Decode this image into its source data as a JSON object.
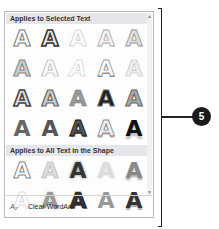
{
  "gallery": {
    "section1_title": "Applies to Selected Text",
    "section2_title": "Applies to All Text in the Shape",
    "glyph": "A",
    "section1_rows": [
      [
        {
          "style": "outline-gray"
        },
        {
          "style": "outline-dark"
        },
        {
          "style": "outline-light"
        },
        {
          "style": "outline-light-gray"
        },
        {
          "style": "outline-mid"
        }
      ],
      [
        {
          "style": "gray-soft"
        },
        {
          "style": "outline-faint"
        },
        {
          "style": "faint-italic"
        },
        {
          "style": "outline-shadow"
        },
        {
          "style": "pale"
        }
      ],
      [
        {
          "style": "dark-outline"
        },
        {
          "style": "gray-outline"
        },
        {
          "style": "gradient-gray"
        },
        {
          "style": "solid-black"
        },
        {
          "style": "outline-gray-mid"
        }
      ],
      [
        {
          "style": "solid-gray"
        },
        {
          "style": "solid-gray"
        },
        {
          "style": "dark-shadow"
        },
        {
          "style": "outline-reflect"
        },
        {
          "style": "black-reflect"
        }
      ]
    ],
    "section2_rows": [
      [
        {
          "style": "outline-gray"
        },
        {
          "style": "gray-faint"
        },
        {
          "style": "dark-glow"
        },
        {
          "style": "pale-glow"
        },
        {
          "style": "gray-reflect"
        }
      ],
      [
        {
          "style": "faint-outline"
        },
        {
          "style": "gray-glow"
        },
        {
          "style": "dark-3d"
        },
        {
          "style": "gray-3d"
        },
        {
          "style": "dark-reflect"
        }
      ]
    ]
  },
  "footer": {
    "icon": "clear-wordart-icon",
    "icon_glyph": "A₂",
    "label": "Clear WordArt"
  },
  "callout": {
    "number": "5"
  }
}
